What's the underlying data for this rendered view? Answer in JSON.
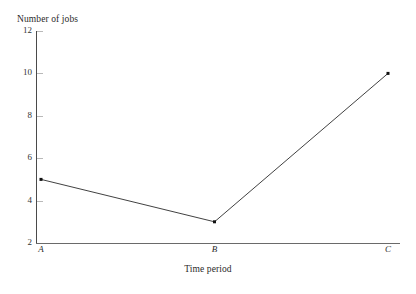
{
  "chart_data": {
    "type": "line",
    "title": "",
    "xlabel": "Time period",
    "ylabel": "Number of jobs",
    "categories": [
      "A",
      "B",
      "C"
    ],
    "values": [
      5,
      3,
      10
    ],
    "series": [
      {
        "name": "Number of jobs",
        "values": [
          5,
          3,
          10
        ]
      }
    ],
    "ylim": [
      2,
      12
    ],
    "yticks": [
      2,
      4,
      6,
      8,
      10,
      12
    ],
    "ytick_labels": [
      "2",
      "4",
      "6",
      "8",
      "10",
      "12"
    ],
    "xticks": [
      "A",
      "B",
      "C"
    ],
    "grid": false,
    "legend": false,
    "legend_position": "none",
    "marker": "square",
    "line_color": "#2b2b2b",
    "marker_color": "#111111",
    "axis_color": "#4a4a4a",
    "background_color": "#ffffff"
  }
}
